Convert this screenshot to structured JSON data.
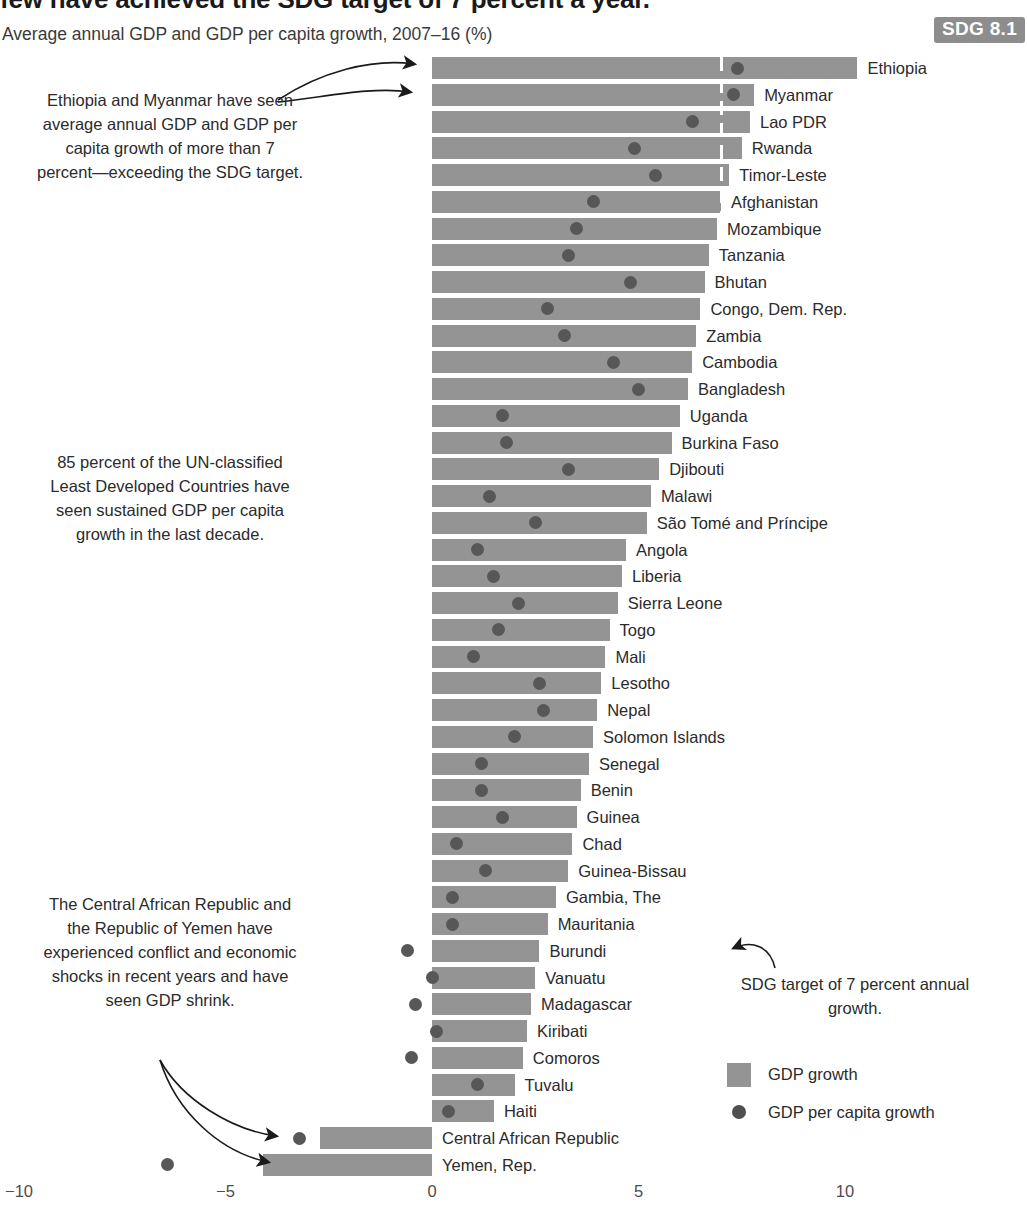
{
  "header": {
    "title": "few have achieved the SDG target of 7 percent a year.",
    "subtitle": "Average annual GDP and GDP per capita growth, 2007–16 (%)",
    "badge": "SDG 8.1"
  },
  "annotations": {
    "left_top": "Ethiopia and Myanmar have seen average annual GDP and GDP per capita growth of more than 7 percent—exceeding the SDG target.",
    "left_middle": "85 percent of the UN-classified Least Developed Countries have seen sustained GDP per capita growth in the last decade.",
    "left_bottom": "The Central African Republic and the Republic of Yemen have experienced conflict and economic shocks in recent years and have seen GDP shrink.",
    "right_target": "SDG target of 7 percent annual growth."
  },
  "legend": {
    "bar_label": "GDP growth",
    "dot_label": "GDP per capita growth"
  },
  "chart_data": {
    "type": "bar",
    "title": "few have achieved the SDG target of 7 percent a year.",
    "subtitle": "Average annual GDP and GDP per capita growth, 2007–16 (%)",
    "xlabel": "",
    "ylabel": "",
    "xlim": [
      -10,
      11
    ],
    "xticks": [
      -10,
      -5,
      0,
      5,
      10
    ],
    "xticklabels": [
      "−10",
      "−5",
      "0",
      "5",
      "10"
    ],
    "grid": false,
    "legend_position": "bottom-right",
    "reference_line": {
      "value": 7,
      "label": "SDG target of 7 percent annual growth.",
      "style": "dashed-white"
    },
    "series": [
      {
        "name": "GDP growth",
        "type": "bar",
        "color": "#949494"
      },
      {
        "name": "GDP per capita growth",
        "type": "dot",
        "color": "#575757"
      }
    ],
    "categories": [
      "Ethiopia",
      "Myanmar",
      "Lao PDR",
      "Rwanda",
      "Timor-Leste",
      "Afghanistan",
      "Mozambique",
      "Tanzania",
      "Bhutan",
      "Congo, Dem. Rep.",
      "Zambia",
      "Cambodia",
      "Bangladesh",
      "Uganda",
      "Burkina Faso",
      "Djibouti",
      "Malawi",
      "São Tomé and Príncipe",
      "Angola",
      "Liberia",
      "Sierra Leone",
      "Togo",
      "Mali",
      "Lesotho",
      "Nepal",
      "Solomon Islands",
      "Senegal",
      "Benin",
      "Guinea",
      "Chad",
      "Guinea-Bissau",
      "Gambia, The",
      "Mauritania",
      "Burundi",
      "Vanuatu",
      "Madagascar",
      "Kiribati",
      "Comoros",
      "Tuvalu",
      "Haiti",
      "Central African Republic",
      "Yemen, Rep."
    ],
    "gdp_growth": [
      10.3,
      7.8,
      7.7,
      7.5,
      7.2,
      7.0,
      6.9,
      6.7,
      6.6,
      6.5,
      6.4,
      6.3,
      6.2,
      6.0,
      5.8,
      5.5,
      5.3,
      5.2,
      4.7,
      4.6,
      4.5,
      4.3,
      4.2,
      4.1,
      4.0,
      3.9,
      3.8,
      3.6,
      3.5,
      3.4,
      3.3,
      3.0,
      2.8,
      2.6,
      2.5,
      2.4,
      2.3,
      2.2,
      2.0,
      1.5,
      -2.7,
      -4.1
    ],
    "gdp_per_capita_growth": [
      7.4,
      7.3,
      6.3,
      4.9,
      5.4,
      3.9,
      3.5,
      3.3,
      4.8,
      2.8,
      3.2,
      4.4,
      5.0,
      1.7,
      1.8,
      3.3,
      1.4,
      2.5,
      1.1,
      1.5,
      2.1,
      1.6,
      1.0,
      2.6,
      2.7,
      2.0,
      1.2,
      1.2,
      1.7,
      0.6,
      1.3,
      0.5,
      0.5,
      -0.6,
      0.0,
      -0.4,
      0.1,
      -0.5,
      1.1,
      0.4,
      -3.2,
      -6.4
    ]
  }
}
